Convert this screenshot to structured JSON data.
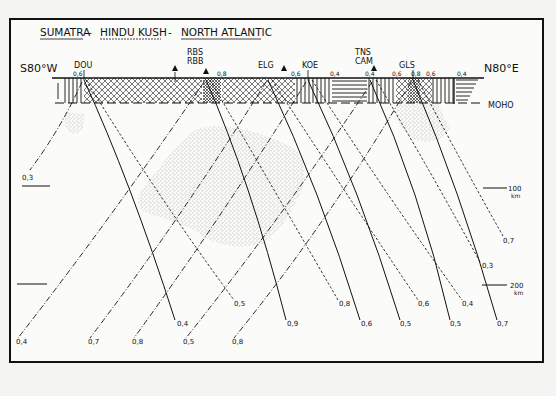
{
  "title": "SUMATRA - HINDU KUSH - NORTH ATLANTIC",
  "title_parts": [
    "SUMATRA",
    "-",
    "HINDU KUSH",
    "-",
    "NORTH ATLANTIC"
  ],
  "direction": {
    "left": "S80°W",
    "right": "N80°E"
  },
  "moho_label": "MOHO",
  "depth_scale": [
    {
      "label": "100",
      "unit": "km"
    },
    {
      "label": "200",
      "unit": "km"
    }
  ],
  "stations": [
    {
      "code": "DOU",
      "x": 83
    },
    {
      "code": "RBS",
      "x": 208
    },
    {
      "code": "RBB",
      "x": 208
    },
    {
      "code": "ELG",
      "x": 268
    },
    {
      "code": "KOE",
      "x": 310
    },
    {
      "code": "TNS",
      "x": 375
    },
    {
      "code": "CAM",
      "x": 375
    },
    {
      "code": "GLS",
      "x": 410
    }
  ],
  "triangles": [
    {
      "x": 175
    },
    {
      "x": 206
    },
    {
      "x": 284
    },
    {
      "x": 374
    }
  ],
  "crust_values": [
    {
      "v": "0,6",
      "x": 76
    },
    {
      "v": "0,8",
      "x": 220
    },
    {
      "v": "0,6",
      "x": 294
    },
    {
      "v": "0,4",
      "x": 332
    },
    {
      "v": "0,4",
      "x": 368
    },
    {
      "v": "0,6",
      "x": 394
    },
    {
      "v": "0,8",
      "x": 412
    },
    {
      "v": "0,6",
      "x": 426
    },
    {
      "v": "0,4",
      "x": 456
    }
  ],
  "ray_end_labels": {
    "left_margin": [
      {
        "v": "0,3",
        "x": 22,
        "y": 175
      }
    ],
    "bottom_dashdot": [
      {
        "v": "0,4",
        "x": 16,
        "y": 341
      },
      {
        "v": "0,7",
        "x": 88,
        "y": 341
      },
      {
        "v": "0,8",
        "x": 132,
        "y": 341
      },
      {
        "v": "0,5",
        "x": 183,
        "y": 341
      },
      {
        "v": "0,8",
        "x": 232,
        "y": 341
      }
    ],
    "bottom_solid": [
      {
        "v": "0,4",
        "x": 177,
        "y": 323
      },
      {
        "v": "0,9",
        "x": 287,
        "y": 323
      },
      {
        "v": "0,6",
        "x": 361,
        "y": 323
      },
      {
        "v": "0,5",
        "x": 400,
        "y": 323
      },
      {
        "v": "0,5",
        "x": 450,
        "y": 323
      },
      {
        "v": "0,7",
        "x": 497,
        "y": 323
      }
    ],
    "bottom_dashed": [
      {
        "v": "0,5",
        "x": 234,
        "y": 303
      },
      {
        "v": "0,8",
        "x": 339,
        "y": 303
      },
      {
        "v": "0,6",
        "x": 418,
        "y": 303
      },
      {
        "v": "0,4",
        "x": 462,
        "y": 303
      },
      {
        "v": "0,3",
        "x": 482,
        "y": 265
      },
      {
        "v": "0,7",
        "x": 503,
        "y": 240
      }
    ]
  },
  "legend": {
    "solid": "ray path (solid)",
    "dashed": "ray path (dashed)",
    "dashdot": "ray path (dash-dot)",
    "stipple": "low-velocity anomaly region"
  }
}
